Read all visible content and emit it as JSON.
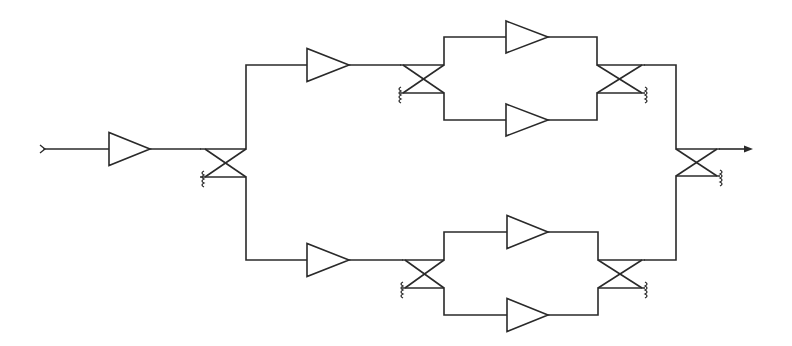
{
  "diagram": {
    "type": "balanced amplifier network schematic",
    "colors": {
      "line": "#2a2a2a",
      "background": "#ffffff"
    },
    "components": {
      "input_port": {
        "label": "input",
        "x": 44,
        "y": 149
      },
      "output_port": {
        "label": "output",
        "x": 752,
        "y": 149
      },
      "amplifiers": [
        {
          "id": "amp-driver",
          "left": 109,
          "tip": 150,
          "cy": 149,
          "h": 33
        },
        {
          "id": "amp-upper-branch",
          "left": 307,
          "tip": 349,
          "cy": 65,
          "h": 33
        },
        {
          "id": "amp-lower-branch",
          "left": 307,
          "tip": 349,
          "cy": 260,
          "h": 33
        },
        {
          "id": "amp-upper-top",
          "left": 506,
          "tip": 548,
          "cy": 37,
          "h": 32
        },
        {
          "id": "amp-upper-bottom",
          "left": 506,
          "tip": 548,
          "cy": 120,
          "h": 32
        },
        {
          "id": "amp-lower-top",
          "left": 507,
          "tip": 548,
          "cy": 232,
          "h": 33
        },
        {
          "id": "amp-lower-bottom",
          "left": 507,
          "tip": 548,
          "cy": 315,
          "h": 33
        }
      ],
      "couplers": [
        {
          "id": "coupler-input-split",
          "x1": 200,
          "x2": 246,
          "top": 149,
          "bottom": 177,
          "termination": "bottom-left"
        },
        {
          "id": "coupler-upper-split",
          "x1": 400,
          "x2": 444,
          "top": 65,
          "bottom": 93,
          "termination": "bottom-left"
        },
        {
          "id": "coupler-upper-combine",
          "x1": 597,
          "x2": 645,
          "top": 65,
          "bottom": 93,
          "termination": "bottom-right"
        },
        {
          "id": "coupler-lower-split",
          "x1": 402,
          "x2": 444,
          "top": 260,
          "bottom": 288,
          "termination": "bottom-left"
        },
        {
          "id": "coupler-lower-combine",
          "x1": 598,
          "x2": 645,
          "top": 260,
          "bottom": 288,
          "termination": "bottom-right"
        },
        {
          "id": "coupler-output-combine",
          "x1": 676,
          "x2": 720,
          "top": 149,
          "bottom": 176,
          "termination": "bottom-right"
        }
      ]
    }
  }
}
